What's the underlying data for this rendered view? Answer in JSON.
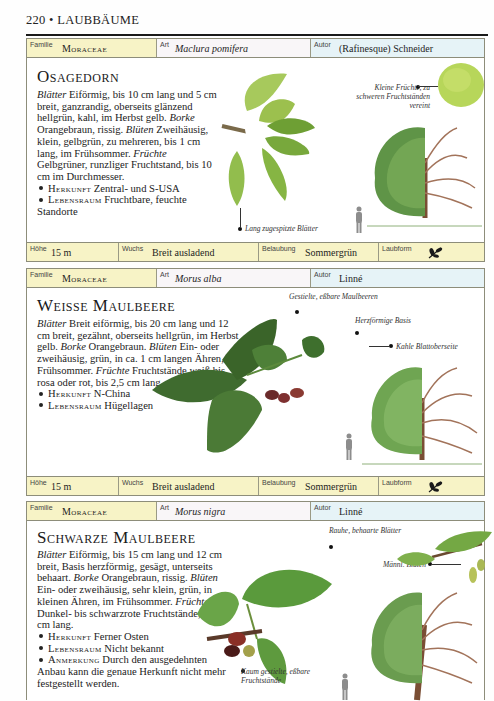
{
  "page": {
    "number": "220",
    "separator": "•",
    "section": "LAUBBÄUME"
  },
  "labels": {
    "family": "Familie",
    "species": "Art",
    "author": "Autor",
    "height": "Höhe",
    "growth": "Wuchs",
    "foliage": "Belaubung",
    "leaf_form": "Laubform"
  },
  "entries": [
    {
      "family": "Moraceae",
      "species": "Maclura pomifera",
      "author": "(Rafinesque) Schneider",
      "title": "Osagedorn",
      "description": [
        {
          "term": "Blätter",
          "text": " Eiförmig, bis 10 cm lang und 5 cm breit, ganzrandig, oberseits glänzend hellgrün, kahl, im Herbst gelb. "
        },
        {
          "term": "Borke",
          "text": " Orangebraun, rissig. "
        },
        {
          "term": "Blüten",
          "text": " Zweihäusig, klein, gelbgrün, zu mehreren, bis 1 cm lang, im Frühsommer. "
        },
        {
          "term": "Früchte",
          "text": " Gelbgrüner, runzliger Fruchtstand, bis 10 cm im Durchmesser."
        }
      ],
      "bullets": [
        {
          "key": "Herkunft",
          "text": " Zentral- und S-USA"
        },
        {
          "key": "Lebensraum",
          "text": " Fruchtbare, feuchte Standorte"
        }
      ],
      "captions": [
        "Kleine Früchte, zu schweren Fruchtständen vereint",
        "Lang zugespitzte Blätter"
      ],
      "height": "15 m",
      "growth": "Breit ausladend",
      "foliage": "Sommergrün",
      "leaf_form_icon": "leaf-sprig-icon"
    },
    {
      "family": "Moraceae",
      "species": "Morus alba",
      "author": "Linné",
      "title": "Weisse Maulbeere",
      "description": [
        {
          "term": "Blätter",
          "text": " Breit eiförmig, bis 20 cm lang und 12 cm breit, gezähnt, oberseits hellgrün, im Herbst gelb. "
        },
        {
          "term": "Borke",
          "text": " Orangebraun. "
        },
        {
          "term": "Blüten",
          "text": " Ein- oder zweihäusig, grün, in ca. 1 cm langen Ähren, im Frühsommer. "
        },
        {
          "term": "Früchte",
          "text": " Fruchtstände weiß bis rosa oder rot, bis 2,5 cm lang."
        }
      ],
      "bullets": [
        {
          "key": "Herkunft",
          "text": " N-China"
        },
        {
          "key": "Lebensraum",
          "text": " Hügellagen"
        }
      ],
      "captions": [
        "Gestielte, eßbare Maulbeeren",
        "Herzförmige Basis",
        "Kahle Blattoberseite"
      ],
      "height": "15 m",
      "growth": "Breit ausladend",
      "foliage": "Sommergrün",
      "leaf_form_icon": "leaf-sprig-icon"
    },
    {
      "family": "Moraceae",
      "species": "Morus nigra",
      "author": "Linné",
      "title": "Schwarze Maulbeere",
      "description": [
        {
          "term": "Blätter",
          "text": " Eiförmig, bis 15 cm lang und 12 cm breit, Basis herzförmig, gesägt, unterseits behaart. "
        },
        {
          "term": "Borke",
          "text": " Orangebraun, rissig. "
        },
        {
          "term": "Blüten",
          "text": " Ein- oder zweihäusig, sehr klein, grün, in kleinen Ähren, im Frühsommer. "
        },
        {
          "term": "Früchte",
          "text": " Dunkel- bis schwarzrote Fruchtstände, bis 2,5 cm lang."
        }
      ],
      "bullets": [
        {
          "key": "Herkunft",
          "text": " Ferner Osten"
        },
        {
          "key": "Lebensraum",
          "text": " Nicht bekannt"
        },
        {
          "key": "Anmerkung",
          "text": " Durch den ausgedehnten Anbau kann die genaue Herkunft nicht mehr festgestellt werden."
        }
      ],
      "captions": [
        "Rauhe, behaarte Blätter",
        "Männl. Blüten",
        "Kaum gestielte, eßbare Fruchtstände"
      ]
    }
  ],
  "colors": {
    "family_bg": "#f7f3c6",
    "species_bg": "#f9f6f8",
    "author_bg": "#e6f3f7",
    "footer_bg": "#f7f3c6",
    "leaf_green": "#7fae3e",
    "tree_green": "#6f9a4e",
    "bark_brown": "#8a5a3c"
  }
}
